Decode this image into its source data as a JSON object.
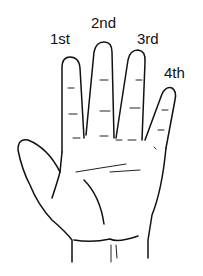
{
  "figure": {
    "labels": {
      "finger_1": "1st",
      "finger_2": "2nd",
      "finger_3": "3rd",
      "finger_4": "4th"
    },
    "colors": {
      "background": "#ffffff",
      "line": "#111111"
    }
  }
}
